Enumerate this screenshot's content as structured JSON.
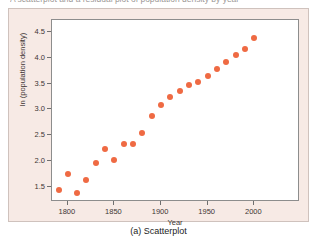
{
  "top_caption": "A scatterplot and a residual plot of population density by year",
  "figure_caption": "(a) Scatterplot",
  "colors": {
    "point": "#ef6a43",
    "panel_background": "#f7eae5",
    "plot_background": "#ffffff",
    "axis": "#8d8d8d",
    "text": "#3e3634"
  },
  "chart_data": {
    "type": "scatter",
    "title": "",
    "xlabel": "Year",
    "ylabel": "ln (population density)",
    "xlim": [
      1783,
      2049
    ],
    "ylim": [
      1.21,
      4.73
    ],
    "xticks": [
      1800,
      1850,
      1900,
      1950,
      2000
    ],
    "xtick_labels": [
      "1800",
      "1850",
      "1900",
      "1950",
      "2000"
    ],
    "yticks": [
      1.5,
      2.0,
      2.5,
      3.0,
      3.5,
      4.0,
      4.5
    ],
    "ytick_labels": [
      "1.5",
      "2.0",
      "2.5",
      "3.0",
      "3.5",
      "4.0",
      "4.5"
    ],
    "grid": false,
    "legend": false,
    "marker": "circle",
    "marker_size": 6,
    "x": [
      1790,
      1800,
      1810,
      1820,
      1830,
      1840,
      1850,
      1860,
      1870,
      1880,
      1890,
      1900,
      1910,
      1920,
      1930,
      1940,
      1950,
      1960,
      1970,
      1980,
      1990,
      2000
    ],
    "y": [
      1.44,
      1.75,
      1.38,
      1.63,
      1.96,
      2.23,
      2.02,
      2.33,
      2.33,
      2.54,
      2.87,
      3.09,
      3.24,
      3.36,
      3.47,
      3.53,
      3.65,
      3.78,
      3.92,
      4.05,
      4.17,
      4.38
    ]
  }
}
